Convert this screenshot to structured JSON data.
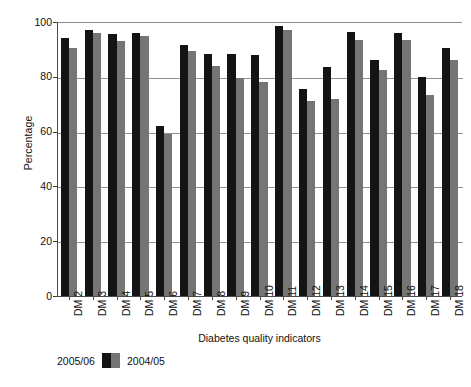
{
  "chart_data": {
    "type": "bar",
    "title": "",
    "xlabel": "Diabetes quality indicators",
    "ylabel": "Percentage",
    "ylim": [
      0,
      100
    ],
    "yticks": [
      0,
      20,
      40,
      60,
      80,
      100
    ],
    "grid": true,
    "legend_position": "bottom-left",
    "categories": [
      "DM 2",
      "DM 3",
      "DM 4",
      "DM 5",
      "DM 6",
      "DM 7",
      "DM 8",
      "DM 9",
      "DM 10",
      "DM 11",
      "DM 12",
      "DM 13",
      "DM 14",
      "DM 15",
      "DM 16",
      "DM 17",
      "DM 18"
    ],
    "series": [
      {
        "name": "2005/06",
        "color": "#141414",
        "values": [
          94,
          97,
          95.5,
          96,
          62,
          91.5,
          88.5,
          88.5,
          88,
          98.5,
          75.5,
          83.5,
          96.5,
          86,
          96,
          80,
          90.5
        ]
      },
      {
        "name": "2004/05",
        "color": "#757575",
        "values": [
          90.5,
          96,
          93,
          95,
          59,
          89.5,
          84,
          79.5,
          78,
          97,
          71,
          72,
          93.5,
          82.5,
          93.5,
          73.5,
          86
        ]
      }
    ]
  },
  "legend": {
    "left_label": "2005/06",
    "right_label": "2004/05"
  },
  "axes": {
    "y_title": "Percentage",
    "x_title": "Diabetes quality indicators"
  }
}
